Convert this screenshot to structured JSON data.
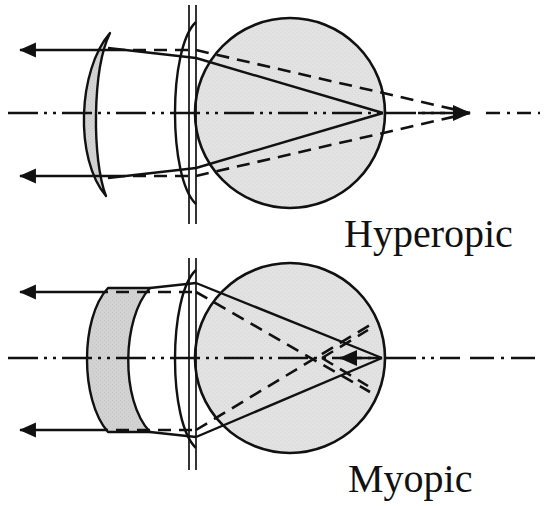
{
  "figure": {
    "background_color": "#ffffff",
    "stroke_color": "#111111",
    "sphere_fill": "#e2e2e2",
    "lens_fill": "#d2d2d2"
  },
  "panels": [
    {
      "id": "hyperopic",
      "label": "Hyperopic",
      "label_x": 344,
      "label_y": 247,
      "lens_type": "positive-meniscus-converging",
      "focus_at_retina": true,
      "uncorrected_focus": "behind-retina",
      "eye": {
        "cx": 290,
        "cy": 113,
        "r": 95
      },
      "cornea_lines_x": [
        189,
        196
      ],
      "cornea_line_top": 5,
      "cornea_line_bottom": 224,
      "axis_y": 113,
      "axis_x_start": 8,
      "axis_x_end": 540,
      "axis_arrow_x": 455,
      "rays": [
        {
          "name": "upper-incident-ray",
          "y": 50,
          "x_start": 20,
          "x_end": 108
        },
        {
          "name": "lower-incident-ray",
          "y": 176,
          "x_start": 20,
          "x_end": 108
        }
      ],
      "solid_focus_x": 383,
      "dashed_focus_x": 470
    },
    {
      "id": "myopic",
      "label": "Myopic",
      "label_x": 348,
      "label_y": 492,
      "lens_type": "negative-meniscus-diverging",
      "focus_at_retina": true,
      "uncorrected_focus": "in-front-of-retina",
      "eye": {
        "cx": 290,
        "cy": 358,
        "r": 95
      },
      "cornea_lines_x": [
        189,
        196
      ],
      "cornea_line_top": 258,
      "cornea_line_bottom": 470,
      "axis_y": 358,
      "axis_x_start": 8,
      "axis_x_end": 540,
      "rays": [
        {
          "name": "upper-incident-ray",
          "y": 292,
          "x_start": 20,
          "x_end": 90
        },
        {
          "name": "lower-incident-ray",
          "y": 430,
          "x_start": 20,
          "x_end": 90
        }
      ],
      "solid_focus_x": 380,
      "dashed_focus_x": 322
    }
  ],
  "legend_notes": {
    "solid_line_meaning": "corrected ray path with lens",
    "dashed_line_meaning": "uncorrected ray path without lens",
    "dash_dot_line_meaning": "optical axis"
  }
}
